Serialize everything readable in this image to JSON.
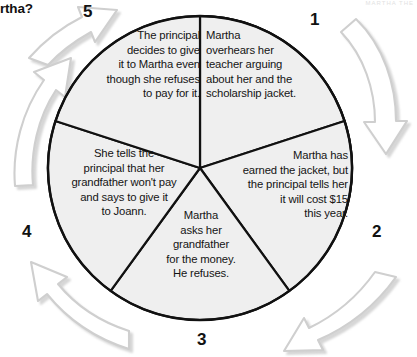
{
  "page": {
    "fragment_left": "rtha?",
    "fragment_right": "MARTHA  THE"
  },
  "diagram": {
    "type": "cycle-wheel",
    "title": "",
    "shape": "circle divided into five wedges with five curved outline arrows around it",
    "colors": {
      "wedge_fill": "#efefef",
      "wedge_stroke": "#000000",
      "arrow_fill": "#ffffff",
      "arrow_stroke": "#cfcfcf",
      "arrow_shadow": "#d9d9d9",
      "text": "#141414",
      "number": "#111111"
    },
    "steps": [
      {
        "number": "1",
        "text": "Martha\noverhears her\nteacher arguing\nabout her and the\nscholarship jacket."
      },
      {
        "number": "2",
        "text": "Martha has\nearned the jacket, but\nthe principal tells her\nit will cost $15\nthis year."
      },
      {
        "number": "3",
        "text": "Martha\nasks her\ngrandfather\nfor the money.\nHe refuses."
      },
      {
        "number": "4",
        "text": "She tells the\nprincipal that her\ngrandfather won't pay\nand says to give it\nto Joann."
      },
      {
        "number": "5",
        "text": "The principal\ndecides to give\nit to Martha even\nthough she refuses\nto pay for it."
      }
    ],
    "arrows": [
      {
        "name": "arrow-1-to-2",
        "direction": "clockwise-down-right"
      },
      {
        "name": "arrow-2-to-3",
        "direction": "clockwise-down-left"
      },
      {
        "name": "arrow-3-to-4",
        "direction": "clockwise-left-up"
      },
      {
        "name": "arrow-4-to-5",
        "direction": "clockwise-up-left"
      },
      {
        "name": "arrow-5-to-1",
        "direction": "clockwise-up-right"
      }
    ]
  }
}
